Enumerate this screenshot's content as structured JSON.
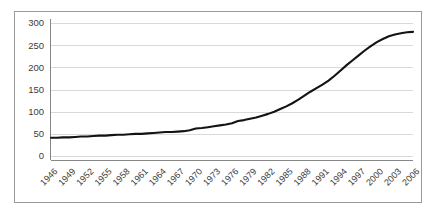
{
  "chart_data": {
    "type": "line",
    "title": "",
    "subtitle": "",
    "xlabel": "",
    "ylabel": "",
    "grid": true,
    "legend": false,
    "legend_position": "none",
    "xlim": [
      1946,
      2006
    ],
    "ylim": [
      0,
      300
    ],
    "y_ticks": [
      0,
      50,
      100,
      150,
      200,
      250,
      300
    ],
    "y_tick_labels": [
      "0",
      "50",
      "100",
      "150",
      "200",
      "250",
      "300"
    ],
    "x_ticks": [
      1946,
      1949,
      1952,
      1955,
      1958,
      1961,
      1964,
      1967,
      1970,
      1973,
      1976,
      1979,
      1982,
      1985,
      1988,
      1991,
      1994,
      1997,
      2000,
      2003,
      2006
    ],
    "x_tick_labels": [
      "1946",
      "1949",
      "1952",
      "1955",
      "1958",
      "1961",
      "1964",
      "1967",
      "1970",
      "1973",
      "1976",
      "1979",
      "1982",
      "1985",
      "1988",
      "1991",
      "1994",
      "1997",
      "2000",
      "2003",
      "2006"
    ],
    "x_tick_rotation": 45,
    "series": [
      {
        "name": "",
        "color": "#131313",
        "x": [
          1946,
          1947,
          1948,
          1949,
          1950,
          1951,
          1952,
          1953,
          1954,
          1955,
          1956,
          1957,
          1958,
          1959,
          1960,
          1961,
          1962,
          1963,
          1964,
          1965,
          1966,
          1967,
          1968,
          1969,
          1970,
          1971,
          1972,
          1973,
          1974,
          1975,
          1976,
          1977,
          1978,
          1979,
          1980,
          1981,
          1982,
          1983,
          1984,
          1985,
          1986,
          1987,
          1988,
          1989,
          1990,
          1991,
          1992,
          1993,
          1994,
          1995,
          1996,
          1997,
          1998,
          1999,
          2000,
          2001,
          2002,
          2003,
          2004,
          2005,
          2006
        ],
        "y": [
          41,
          41,
          42,
          42,
          43,
          44,
          44,
          45,
          46,
          46,
          47,
          48,
          48,
          49,
          50,
          50,
          51,
          52,
          53,
          54,
          54,
          55,
          56,
          58,
          62,
          63,
          65,
          67,
          69,
          71,
          74,
          79,
          81,
          84,
          87,
          91,
          95,
          100,
          106,
          112,
          119,
          127,
          136,
          145,
          153,
          161,
          170,
          181,
          193,
          205,
          216,
          227,
          238,
          248,
          257,
          264,
          270,
          274,
          277,
          279,
          280
        ]
      }
    ]
  },
  "axes": {
    "y_axis_name": "y-axis",
    "x_axis_name": "x-axis"
  }
}
